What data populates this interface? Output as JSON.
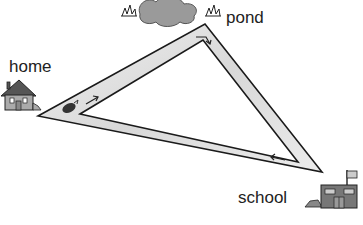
{
  "labels": {
    "home": "home",
    "pond": "pond",
    "school": "school"
  },
  "diagram": {
    "type": "route-triangle",
    "locations": [
      "home",
      "pond",
      "school"
    ],
    "route": "home → pond → school → home",
    "arrows": [
      {
        "segment": "home-to-pond",
        "direction": "toward pond"
      },
      {
        "segment": "pond-to-school",
        "direction": "toward school"
      },
      {
        "segment": "school-to-home",
        "direction": "toward home"
      }
    ],
    "colors": {
      "path_fill": "#e6e6e6",
      "outline": "#1a1a1a",
      "pond": "#9a9a9a"
    }
  }
}
